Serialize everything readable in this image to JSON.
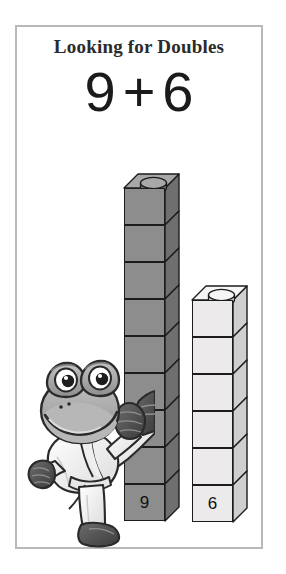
{
  "card": {
    "title": "Looking for Doubles",
    "equation": {
      "left_addend": "9",
      "operator": "+",
      "right_addend": "6",
      "full": "9 + 6"
    },
    "border_color": "#b9b9bc",
    "background_color": "#ffffff"
  },
  "towers": [
    {
      "name": "tower-nine",
      "label": "9",
      "cube_count": 9,
      "color": "#8d8d8d",
      "side_color": "#6f6f6f",
      "top_color": "#a8a8a8",
      "outline_color": "#1c1c1c"
    },
    {
      "name": "tower-six",
      "label": "6",
      "cube_count": 6,
      "color": "#eceaea",
      "side_color": "#cfcfcf",
      "top_color": "#f7f6f6",
      "outline_color": "#1c1c1c"
    }
  ],
  "character": {
    "name": "karate-frog",
    "description": "cartoon frog in white karate gi performing a high kick",
    "body_color": "#9a9a9a",
    "gi_color": "#fbfbfb",
    "outline_color": "#2a2a2a"
  }
}
